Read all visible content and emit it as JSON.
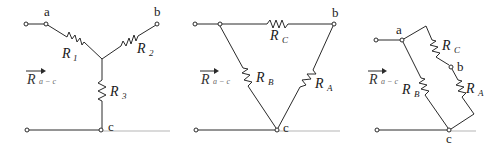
{
  "figure": {
    "colors": {
      "wire": "#2a2a2a",
      "baseline": "#b5b5b5",
      "background": "#ffffff"
    }
  },
  "measurement_label": {
    "main": "R",
    "sub": "a − c"
  },
  "panels": [
    {
      "name": "wye",
      "nodes": {
        "a": "a",
        "b": "b",
        "c": "c"
      },
      "resistors": [
        {
          "main": "R",
          "sub": "1"
        },
        {
          "main": "R",
          "sub": "2"
        },
        {
          "main": "R",
          "sub": "3"
        }
      ]
    },
    {
      "name": "delta",
      "nodes": {
        "b": "b",
        "c": "c"
      },
      "resistors": [
        {
          "main": "R",
          "sub": "C"
        },
        {
          "main": "R",
          "sub": "B"
        },
        {
          "main": "R",
          "sub": "A"
        }
      ]
    },
    {
      "name": "delta-redrawn",
      "nodes": {
        "a": "a",
        "b": "b",
        "c": "c"
      },
      "resistors": [
        {
          "main": "R",
          "sub": "C"
        },
        {
          "main": "R",
          "sub": "B"
        },
        {
          "main": "R",
          "sub": "A"
        }
      ]
    }
  ]
}
